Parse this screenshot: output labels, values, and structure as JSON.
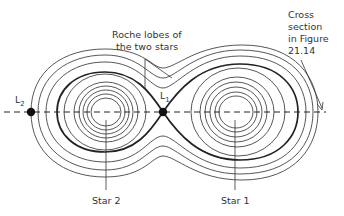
{
  "figure": {
    "annotations": {
      "roche_lobes_line1": "Roche lobes of",
      "roche_lobes_line2": "the two stars",
      "cross_section_line1": "Cross",
      "cross_section_line2": "section",
      "cross_section_line3": "in Figure",
      "cross_section_line4": "21.14",
      "l1_letter": "L",
      "l1_sub": "1",
      "l2_letter": "L",
      "l2_sub": "2",
      "star1": "Star 1",
      "star2": "Star 2"
    },
    "points": [
      {
        "name": "L1",
        "x": 163,
        "y": 112
      },
      {
        "name": "L2",
        "x": 31,
        "y": 112
      }
    ],
    "stars": [
      {
        "name": "Star 2",
        "cx": 106,
        "cy": 112
      },
      {
        "name": "Star 1",
        "cx": 236,
        "cy": 112
      }
    ],
    "colors": {
      "line": "#333333",
      "background": "#ffffff"
    }
  }
}
